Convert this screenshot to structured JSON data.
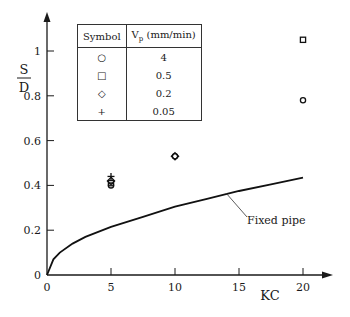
{
  "chart_data": {
    "type": "scatter",
    "title": "",
    "xlabel": "KC",
    "ylabel": "S/D",
    "ylabel_num": "S",
    "ylabel_den": "D",
    "xlim": [
      0,
      22
    ],
    "ylim": [
      0,
      1.12
    ],
    "x_ticks": [
      0,
      5,
      10,
      15,
      20
    ],
    "y_ticks": [
      0,
      0.2,
      0.4,
      0.6,
      0.8,
      1
    ],
    "y_tick_labels": [
      "0",
      "0.2",
      "0.4",
      "0.6",
      "0.8",
      "1"
    ],
    "x_tick_labels": [
      "0",
      "5",
      "10",
      "15",
      "20"
    ],
    "grid": false,
    "legend_position": "upper-left table",
    "legend_headers": [
      "Symbol",
      "Vp (mm/min)"
    ],
    "series": [
      {
        "name": "4",
        "marker": "circle",
        "points": [
          [
            5,
            0.4
          ],
          [
            10,
            0.53
          ],
          [
            20,
            0.78
          ]
        ]
      },
      {
        "name": "0.5",
        "marker": "square",
        "points": [
          [
            5,
            0.41
          ],
          [
            20,
            1.05
          ]
        ]
      },
      {
        "name": "0.2",
        "marker": "diamond",
        "points": [
          [
            5,
            0.42
          ],
          [
            10,
            0.53
          ]
        ]
      },
      {
        "name": "0.05",
        "marker": "plus",
        "points": [
          [
            5,
            0.44
          ]
        ]
      }
    ],
    "curve": {
      "name": "Fixed pipe",
      "type": "line",
      "points": [
        [
          0,
          0
        ],
        [
          0.5,
          0.07
        ],
        [
          1,
          0.1
        ],
        [
          2,
          0.14
        ],
        [
          3,
          0.17
        ],
        [
          5,
          0.215
        ],
        [
          7.5,
          0.26
        ],
        [
          10,
          0.305
        ],
        [
          12.5,
          0.34
        ],
        [
          15,
          0.375
        ],
        [
          17.5,
          0.405
        ],
        [
          20,
          0.435
        ]
      ],
      "annotation": "Fixed pipe"
    }
  },
  "legend": {
    "header_symbol": "Symbol",
    "header_vp_main": "V",
    "header_vp_sub": "p",
    "header_vp_unit": " (mm/min)",
    "rows": [
      {
        "symbol": "○",
        "value": "4"
      },
      {
        "symbol": "□",
        "value": "0.5"
      },
      {
        "symbol": "◇",
        "value": "0.2"
      },
      {
        "symbol": "+",
        "value": "0.05"
      }
    ]
  }
}
